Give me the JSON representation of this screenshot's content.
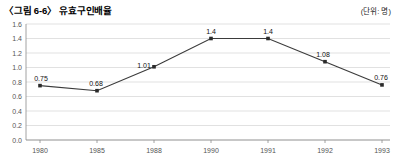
{
  "figure": {
    "title": "〈그림 6-6〉 유효구인배율",
    "unit_label": "(단위: 명)"
  },
  "chart_data": {
    "type": "line",
    "title": "〈그림 6-6〉 유효구인배율",
    "xlabel": "",
    "ylabel": "",
    "unit": "(단위: 명)",
    "categories": [
      "1980",
      "1985",
      "1988",
      "1990",
      "1991",
      "1992",
      "1993"
    ],
    "values": [
      0.75,
      0.68,
      1.01,
      1.4,
      1.4,
      1.08,
      0.76
    ],
    "point_labels": [
      "0.75",
      "0.68",
      "1.01",
      "1.4",
      "1.4",
      "1.08",
      "0.76"
    ],
    "ylim": [
      0.0,
      1.6
    ],
    "ytick_labels": [
      "0.0",
      "0.2",
      "0.4",
      "0.6",
      "0.8",
      "1.0",
      "1.2",
      "1.4",
      "1.6"
    ],
    "ytick_values": [
      0.0,
      0.2,
      0.4,
      0.6,
      0.8,
      1.0,
      1.2,
      1.4,
      1.6
    ],
    "grid": true,
    "legend": "none",
    "series_color": "#3b3b3b",
    "grid_color": "#d4d4d4",
    "axis_color": "#8a8a8a"
  }
}
